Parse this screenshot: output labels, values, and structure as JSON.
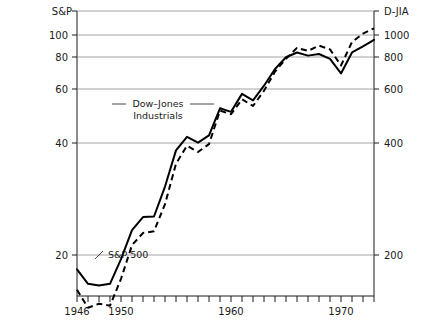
{
  "chart_data": {
    "type": "line",
    "title": "",
    "subtitle": "",
    "xlabel": "",
    "ylabel": "S&P",
    "y2label": "D-JIA",
    "grid": true,
    "legend_position": "inline-annotation",
    "yscale": "log",
    "xlim": [
      1946,
      1973
    ],
    "ylim": [
      14,
      118
    ],
    "y2lim": [
      140,
      1180
    ],
    "yticks": [
      20,
      40,
      60,
      80,
      100
    ],
    "yticklabels": [
      "20",
      "40",
      "60",
      "80",
      "100"
    ],
    "y2ticks": [
      200,
      400,
      600,
      800,
      1000
    ],
    "y2ticklabels": [
      "200",
      "400",
      "600",
      "800",
      "1000"
    ],
    "xticks": [
      1946,
      1947,
      1948,
      1949,
      1950,
      1951,
      1952,
      1953,
      1954,
      1955,
      1956,
      1957,
      1958,
      1959,
      1960,
      1961,
      1962,
      1963,
      1964,
      1965,
      1966,
      1967,
      1968,
      1969,
      1970,
      1971,
      1972,
      1973
    ],
    "xticklabels_shown": [
      "1946",
      "1950",
      "1960",
      "1970"
    ],
    "xticklabel_years": [
      1946,
      1950,
      1960,
      1970
    ],
    "series": [
      {
        "name": "Dow-Jones Industrials",
        "label_line1": "Dow–Jones",
        "label_line2": "Industrials",
        "style": "solid",
        "color": "#000000",
        "axis": "left",
        "x": [
          1946,
          1947,
          1948,
          1949,
          1950,
          1951,
          1952,
          1953,
          1954,
          1955,
          1956,
          1957,
          1958,
          1959,
          1960,
          1961,
          1962,
          1963,
          1964,
          1965,
          1966,
          1967,
          1968,
          1969,
          1970,
          1971,
          1972,
          1973
        ],
        "values": [
          18.0,
          16.2,
          16.0,
          16.2,
          19.4,
          24.0,
          26.4,
          26.5,
          33.0,
          43.0,
          47.5,
          45.5,
          48.0,
          58.5,
          57.0,
          65.0,
          62.0,
          69.0,
          78.0,
          85.0,
          88.0,
          86.0,
          87.0,
          84.0,
          75.5,
          88.0,
          92.0,
          96.5
        ]
      },
      {
        "name": "S&P 500",
        "label_line1": "S&P 500",
        "style": "dashed",
        "color": "#000000",
        "axis": "right",
        "x": [
          1946,
          1947,
          1948,
          1949,
          1950,
          1951,
          1952,
          1953,
          1954,
          1955,
          1956,
          1957,
          1958,
          1959,
          1960,
          1961,
          1962,
          1963,
          1964,
          1965,
          1966,
          1967,
          1968,
          1969,
          1970,
          1971,
          1972,
          1973
        ],
        "values": [
          15.5,
          13.6,
          14.0,
          13.8,
          16.8,
          21.5,
          23.5,
          23.8,
          29.0,
          39.0,
          44.5,
          42.5,
          45.0,
          57.5,
          56.0,
          62.5,
          59.5,
          66.5,
          76.5,
          84.0,
          91.0,
          89.0,
          92.5,
          90.0,
          80.0,
          95.0,
          101.0,
          105.0
        ]
      }
    ],
    "annotations": [
      {
        "text": "Dow–Jones Industrials",
        "kind": "series-callout",
        "has_leader_line": true
      },
      {
        "text": "S&P 500",
        "kind": "series-callout",
        "has_leader_line": true
      }
    ]
  },
  "axes": {
    "left_title": "S&P",
    "right_title": "D-JIA"
  }
}
